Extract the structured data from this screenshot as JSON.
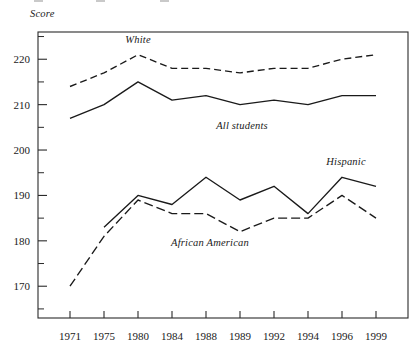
{
  "chart_data": {
    "type": "line",
    "title": "",
    "subtitle": "",
    "xlabel": "",
    "ylabel": "Score",
    "categories": [
      "1971",
      "1975",
      "1980",
      "1984",
      "1988",
      "1989",
      "1992",
      "1994",
      "1996",
      "1999"
    ],
    "ylim": [
      163,
      226
    ],
    "yticks_major": [
      220,
      210,
      200,
      190,
      180,
      170
    ],
    "yticks_minor": [
      225,
      215,
      205,
      195,
      185,
      175,
      165
    ],
    "grid": false,
    "legend": "inline-annotations",
    "series": [
      {
        "name": "White",
        "style": "dashed",
        "label_x_category": "1980",
        "values": [
          214,
          217,
          221,
          218,
          218,
          217,
          218,
          218,
          220,
          221
        ]
      },
      {
        "name": "All students",
        "style": "solid",
        "label_x_category": "1989",
        "values": [
          207,
          210,
          215,
          211,
          212,
          210,
          211,
          210,
          212,
          212
        ]
      },
      {
        "name": "Hispanic",
        "style": "solid",
        "label_x_category": "1996",
        "values": [
          null,
          183,
          190,
          188,
          194,
          189,
          192,
          186,
          194,
          192
        ]
      },
      {
        "name": "African American",
        "style": "dashed",
        "label_x_category": "1988",
        "values": [
          170,
          181,
          189,
          186,
          186,
          182,
          185,
          185,
          190,
          185
        ]
      }
    ]
  },
  "axis": {
    "y_title": "Score",
    "tick_labels_y": [
      "220",
      "210",
      "200",
      "190",
      "180",
      "170"
    ],
    "tick_labels_x": [
      "1971",
      "1975",
      "1980",
      "1984",
      "1988",
      "1989",
      "1992",
      "1994",
      "1996",
      "1999"
    ]
  },
  "annotations": {
    "white": "White",
    "all_students": "All students",
    "hispanic": "Hispanic",
    "african_american": "African American"
  },
  "colors": {
    "ink": "#1a1a1a",
    "frame": "#2a2a2a",
    "background": "#ffffff",
    "artifact": "#c9c9c9"
  }
}
